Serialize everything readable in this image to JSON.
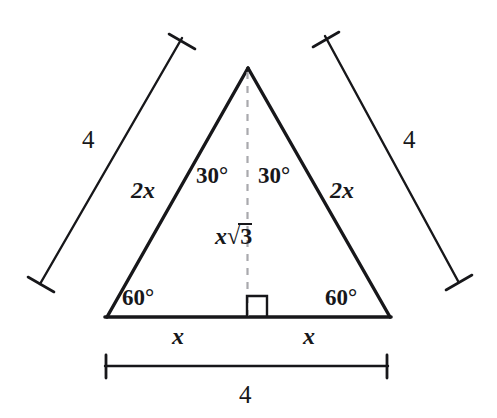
{
  "figure": {
    "stroke_color": "#17171a",
    "dash_color": "#a9a9ad",
    "background": "#ffffff"
  },
  "triangle": {
    "apex": {
      "x": 248,
      "y": 68
    },
    "left_vertex": {
      "x": 107,
      "y": 317
    },
    "right_vertex": {
      "x": 390,
      "y": 317
    },
    "foot": {
      "x": 248,
      "y": 317
    }
  },
  "labels": {
    "angle_top_left": "30°",
    "angle_top_right": "30°",
    "angle_base_left": "60°",
    "angle_base_right": "60°",
    "side_left": "2x",
    "side_right": "2x",
    "altitude_var": "x",
    "altitude_radical_index": "3",
    "base_left_half": "x",
    "base_right_half": "x",
    "bracket_left_value": "4",
    "bracket_right_value": "4",
    "bracket_bottom_value": "4"
  },
  "brackets": {
    "left": {
      "x1": 182,
      "y1": 38,
      "x2": 40,
      "y2": 284,
      "label": "4"
    },
    "right": {
      "x1": 325,
      "y1": 36,
      "x2": 458,
      "y2": 281,
      "label": "4"
    },
    "bottom": {
      "x1": 105,
      "y1": 366,
      "x2": 388,
      "y2": 366,
      "label": "4"
    }
  },
  "right_angle_marker": {
    "x": 247,
    "y": 296,
    "size": 20
  }
}
